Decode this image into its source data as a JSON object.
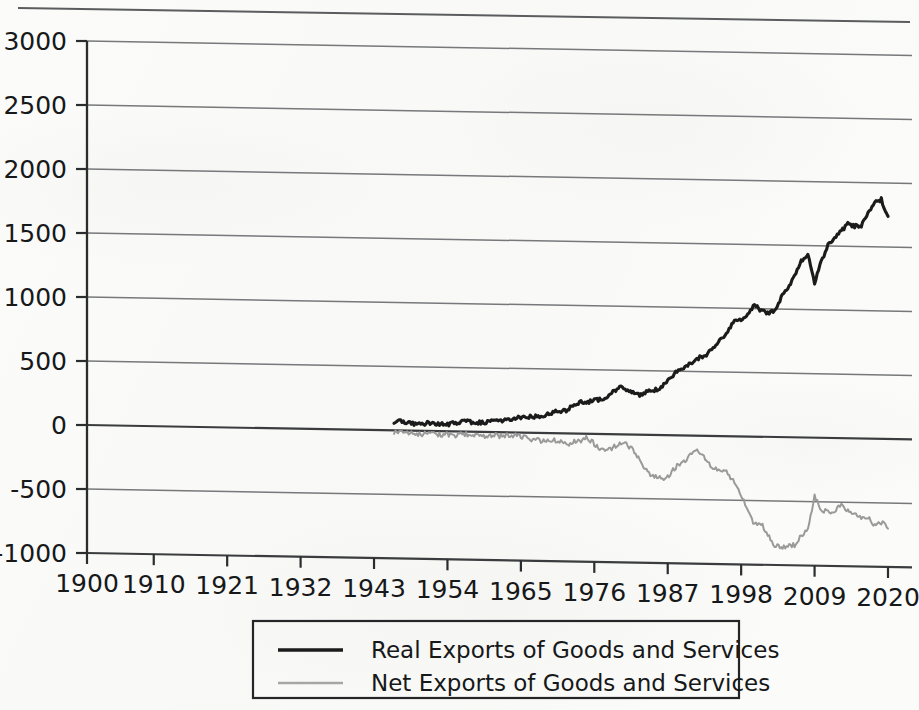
{
  "chart_data": {
    "type": "line",
    "title": "",
    "xlabel": "",
    "ylabel": "",
    "xlim": [
      1900,
      2020
    ],
    "ylim": [
      -1000,
      3000
    ],
    "grid": true,
    "legend_position": "bottom",
    "x_tick_labels": [
      "1900",
      "1910",
      "1921",
      "1932",
      "1943",
      "1954",
      "1965",
      "1976",
      "1987",
      "1998",
      "2009",
      "2020"
    ],
    "x_tick_values": [
      1900,
      1910,
      1921,
      1932,
      1943,
      1954,
      1965,
      1976,
      1987,
      1998,
      2009,
      2020
    ],
    "y_tick_labels": [
      "3000",
      "2500",
      "2000",
      "1500",
      "1000",
      "500",
      "0",
      "-500",
      "-1000"
    ],
    "y_tick_values": [
      3000,
      2500,
      2000,
      1500,
      1000,
      500,
      0,
      -500,
      -1000
    ],
    "series": [
      {
        "name": "Real Exports of Goods and Services",
        "color": "#1b1b1b",
        "width": 3.1,
        "x": [
          1946,
          1947,
          1948,
          1949,
          1950,
          1951,
          1952,
          1953,
          1954,
          1955,
          1956,
          1957,
          1958,
          1959,
          1960,
          1961,
          1962,
          1963,
          1964,
          1965,
          1966,
          1967,
          1968,
          1969,
          1970,
          1971,
          1972,
          1973,
          1974,
          1975,
          1976,
          1977,
          1978,
          1979,
          1980,
          1981,
          1982,
          1983,
          1984,
          1985,
          1986,
          1987,
          1988,
          1989,
          1990,
          1991,
          1992,
          1993,
          1994,
          1995,
          1996,
          1997,
          1998,
          1999,
          2000,
          2001,
          2002,
          2003,
          2004,
          2005,
          2006,
          2007,
          2008,
          2009,
          2010,
          2011,
          2012,
          2013,
          2014,
          2015,
          2016,
          2017,
          2018,
          2019,
          2020
        ],
        "values": [
          55,
          72,
          60,
          52,
          48,
          62,
          58,
          52,
          56,
          64,
          75,
          80,
          68,
          72,
          80,
          82,
          88,
          96,
          112,
          114,
          122,
          124,
          135,
          143,
          165,
          170,
          185,
          225,
          250,
          248,
          262,
          270,
          300,
          340,
          370,
          352,
          318,
          312,
          338,
          348,
          372,
          420,
          480,
          520,
          555,
          580,
          620,
          640,
          695,
          760,
          820,
          900,
          915,
          950,
          1040,
          985,
          965,
          990,
          1090,
          1160,
          1270,
          1385,
          1430,
          1215,
          1380,
          1500,
          1560,
          1615,
          1675,
          1660,
          1660,
          1760,
          1840,
          1870,
          1740
        ]
      },
      {
        "name": "Net Exports of Goods and Services",
        "color": "#9a9a9a",
        "width": 2.0,
        "x": [
          1946,
          1947,
          1948,
          1949,
          1950,
          1951,
          1952,
          1953,
          1954,
          1955,
          1956,
          1957,
          1958,
          1959,
          1960,
          1961,
          1962,
          1963,
          1964,
          1965,
          1966,
          1967,
          1968,
          1969,
          1970,
          1971,
          1972,
          1973,
          1974,
          1975,
          1976,
          1977,
          1978,
          1979,
          1980,
          1981,
          1982,
          1983,
          1984,
          1985,
          1986,
          1987,
          1988,
          1989,
          1990,
          1991,
          1992,
          1993,
          1994,
          1995,
          1996,
          1997,
          1998,
          1999,
          2000,
          2001,
          2002,
          2003,
          2004,
          2005,
          2006,
          2007,
          2008,
          2009,
          2010,
          2011,
          2012,
          2013,
          2014,
          2015,
          2016,
          2017,
          2018,
          2019,
          2020
        ],
        "values": [
          -15,
          -12,
          -18,
          -20,
          -28,
          -22,
          -25,
          -30,
          -26,
          -30,
          -24,
          -20,
          -32,
          -40,
          -28,
          -26,
          -30,
          -28,
          -20,
          -32,
          -48,
          -50,
          -62,
          -60,
          -52,
          -72,
          -90,
          -60,
          -55,
          -30,
          -80,
          -120,
          -125,
          -95,
          -60,
          -85,
          -135,
          -210,
          -300,
          -320,
          -340,
          -330,
          -260,
          -210,
          -180,
          -110,
          -150,
          -200,
          -260,
          -265,
          -290,
          -355,
          -455,
          -580,
          -690,
          -670,
          -760,
          -845,
          -870,
          -855,
          -840,
          -760,
          -730,
          -450,
          -560,
          -580,
          -580,
          -520,
          -560,
          -600,
          -610,
          -620,
          -680,
          -650,
          -700
        ]
      }
    ]
  },
  "legend": {
    "items": [
      {
        "label": "Real Exports of Goods and Services",
        "swatch": "solid-dark-line"
      },
      {
        "label": "Net Exports of Goods and Services",
        "swatch": "solid-gray-line"
      }
    ]
  }
}
